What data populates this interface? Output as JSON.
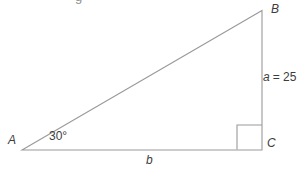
{
  "diagram": {
    "type": "right-triangle",
    "cropped_caption_fragment": "g",
    "vertices": {
      "A": "A",
      "B": "B",
      "C": "C"
    },
    "angle_A": "30°",
    "side_a_var": "a",
    "side_a_value": "= 25",
    "side_b_var": "b"
  },
  "colors": {
    "line": "#9a9a9a",
    "text": "#3d3d3d",
    "background": "#ffffff"
  }
}
